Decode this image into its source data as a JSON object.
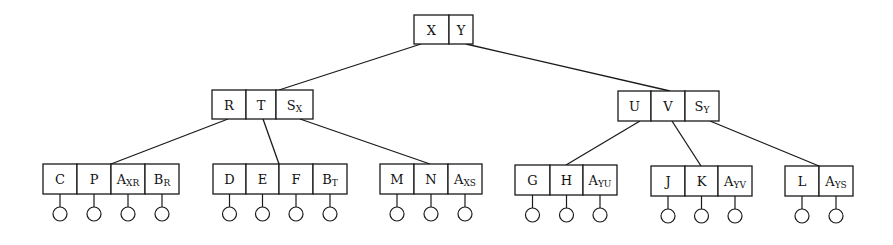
{
  "diagram": {
    "type": "b-tree",
    "colors": {
      "stroke": "#1a1a1a",
      "text": "#111111",
      "background": "#ffffff"
    },
    "nodes": [
      {
        "id": "root",
        "x": 414,
        "y": 15,
        "h": 29,
        "cells": [
          {
            "main": "X",
            "sub": "",
            "w": 35
          },
          {
            "main": "Y",
            "sub": "",
            "w": 24
          }
        ]
      },
      {
        "id": "left-internal",
        "x": 212,
        "y": 90,
        "h": 29,
        "cells": [
          {
            "main": "R",
            "sub": "",
            "w": 34
          },
          {
            "main": "T",
            "sub": "",
            "w": 30
          },
          {
            "main": "S",
            "sub": "X",
            "w": 37
          }
        ]
      },
      {
        "id": "right-internal",
        "x": 618,
        "y": 91,
        "h": 30,
        "cells": [
          {
            "main": "U",
            "sub": "",
            "w": 33
          },
          {
            "main": "V",
            "sub": "",
            "w": 34
          },
          {
            "main": "S",
            "sub": "Y",
            "w": 34
          }
        ]
      },
      {
        "id": "leaf-1",
        "x": 43,
        "y": 164,
        "h": 30,
        "leaves": true,
        "cells": [
          {
            "main": "C",
            "sub": "",
            "w": 34
          },
          {
            "main": "P",
            "sub": "",
            "w": 34
          },
          {
            "main": "A",
            "sub": "XR",
            "w": 34
          },
          {
            "main": "B",
            "sub": "R",
            "w": 34
          }
        ]
      },
      {
        "id": "leaf-2",
        "x": 213,
        "y": 164,
        "h": 30,
        "leaves": true,
        "cells": [
          {
            "main": "D",
            "sub": "",
            "w": 33
          },
          {
            "main": "E",
            "sub": "",
            "w": 33
          },
          {
            "main": "F",
            "sub": "",
            "w": 34
          },
          {
            "main": "B",
            "sub": "T",
            "w": 34
          }
        ]
      },
      {
        "id": "leaf-3",
        "x": 380,
        "y": 164,
        "h": 30,
        "leaves": true,
        "cells": [
          {
            "main": "M",
            "sub": "",
            "w": 34
          },
          {
            "main": "N",
            "sub": "",
            "w": 34
          },
          {
            "main": "A",
            "sub": "XS",
            "w": 34
          }
        ]
      },
      {
        "id": "leaf-4",
        "x": 515,
        "y": 165,
        "h": 30,
        "leaves": true,
        "cells": [
          {
            "main": "G",
            "sub": "",
            "w": 35
          },
          {
            "main": "H",
            "sub": "",
            "w": 33
          },
          {
            "main": "A",
            "sub": "YU",
            "w": 34
          }
        ]
      },
      {
        "id": "leaf-5",
        "x": 651,
        "y": 166,
        "h": 30,
        "leaves": true,
        "cells": [
          {
            "main": "J",
            "sub": "",
            "w": 34
          },
          {
            "main": "K",
            "sub": "",
            "w": 33
          },
          {
            "main": "A",
            "sub": "YV",
            "w": 34
          }
        ]
      },
      {
        "id": "leaf-6",
        "x": 785,
        "y": 166,
        "h": 30,
        "leaves": true,
        "cells": [
          {
            "main": "L",
            "sub": "",
            "w": 34
          },
          {
            "main": "A",
            "sub": "YS",
            "w": 34
          }
        ]
      }
    ],
    "edges": [
      {
        "from": "root",
        "to": "left-internal",
        "x1": 421,
        "y1": 44,
        "x2": 279,
        "y2": 90
      },
      {
        "from": "root",
        "to": "right-internal",
        "x1": 466,
        "y1": 44,
        "x2": 670,
        "y2": 91
      },
      {
        "from": "left-internal",
        "to": "leaf-1",
        "x1": 228,
        "y1": 119,
        "x2": 111,
        "y2": 164
      },
      {
        "from": "left-internal",
        "to": "leaf-2",
        "x1": 263,
        "y1": 119,
        "x2": 279,
        "y2": 164
      },
      {
        "from": "left-internal",
        "to": "leaf-3",
        "x1": 300,
        "y1": 119,
        "x2": 430,
        "y2": 164
      },
      {
        "from": "right-internal",
        "to": "leaf-4",
        "x1": 640,
        "y1": 121,
        "x2": 566,
        "y2": 165
      },
      {
        "from": "right-internal",
        "to": "leaf-5",
        "x1": 672,
        "y1": 121,
        "x2": 701,
        "y2": 166
      },
      {
        "from": "right-internal",
        "to": "leaf-6",
        "x1": 710,
        "y1": 121,
        "x2": 819,
        "y2": 166
      }
    ],
    "leaf_marker": {
      "shape": "circle",
      "radius": 7,
      "stem_length": 13
    }
  }
}
